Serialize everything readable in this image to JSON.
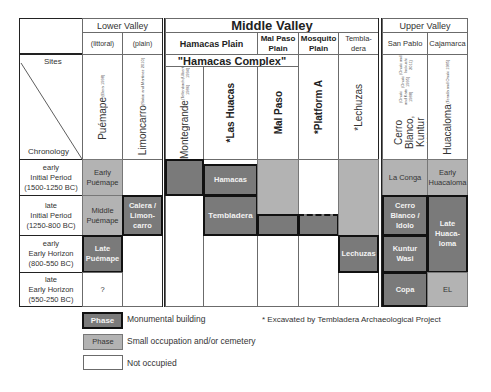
{
  "regions": {
    "lower_valley": "Lower Valley",
    "middle_valley": "Middle Valley",
    "upper_valley": "Upper Valley"
  },
  "subregions": {
    "littoral": "(littoral)",
    "plain": "(plain)",
    "hamacas_plain": "Hamacas Plain",
    "mal_paso_plain": "Mal Paso Plain",
    "mosquito_plain": "Mosquito Plain",
    "tembladera": "Tembla-dera",
    "san_pablo": "San Pablo",
    "cajamarca": "Cajamarca"
  },
  "hamacas_complex": "\"Hamacas Complex\"",
  "corner": {
    "sites": "Sites",
    "chronology": "Chronology"
  },
  "sites": [
    {
      "name": "Puémape",
      "refs": [
        "(Elera 1998)"
      ]
    },
    {
      "name": "Limoncarro",
      "refs": [
        "(Sakai and Martínez 2010)"
      ]
    },
    {
      "name": "Montegrande",
      "refs": [
        "(Tellenbach 1986)",
        "(Ulbert 1994)"
      ]
    },
    {
      "name": "*Las Huacas",
      "refs": []
    },
    {
      "name": "Mal Paso",
      "refs": []
    },
    {
      "name": "*Platform A",
      "refs": []
    },
    {
      "name": "*Lechuzas",
      "refs": []
    },
    {
      "name": "Cerro Blanco, Kuntur Wasi",
      "refs": [
        "(Onuki and Kato 1988)",
        "(Onuki 1995)",
        "(Onuki and Inokuchi 2011)"
      ]
    },
    {
      "name": "Huacaloma",
      "refs": [
        "(Terada and Onuki 1985)"
      ]
    }
  ],
  "periods": [
    {
      "sub": "early",
      "name": "Initial Period",
      "range": "(1500-1250 BC)"
    },
    {
      "sub": "late",
      "name": "Initial Period",
      "range": "(1250-800 BC)"
    },
    {
      "sub": "early",
      "name": "Early Horizon",
      "range": "(800-550 BC)"
    },
    {
      "sub": "late",
      "name": "Early Horizon",
      "range": "(550-250 BC)"
    }
  ],
  "phases": {
    "early_puemape": "Early Puémape",
    "middle_puemape": "Middle Puémape",
    "late_puemape": "Late Puémape",
    "puemape_unknown": "?",
    "calera_limoncarro": "Calera / Limon-carro",
    "hamacas": "Hamacas",
    "tembladera": "Tembladera",
    "lechuzas": "Lechuzas",
    "la_conga": "La Conga",
    "cerro_blanco_idolo": "Cerro Blanco / Idolo",
    "kuntur_wasi": "Kuntur Wasi",
    "copa": "Copa",
    "early_huacaloma": "Early Huacaloma",
    "late_huacaloma": "Late Huaca-loma",
    "el": "EL"
  },
  "legend": {
    "phase_label": "Phase",
    "monumental": "Monumental building",
    "small": "Small occupation and/or cemetery",
    "not_occupied": "Not occupied",
    "note": "* Excavated by Tembladera Archaeological Project"
  },
  "colors": {
    "monumental": "#7a7a7a",
    "small": "#b3b3b3",
    "not_occupied": "#ffffff"
  }
}
